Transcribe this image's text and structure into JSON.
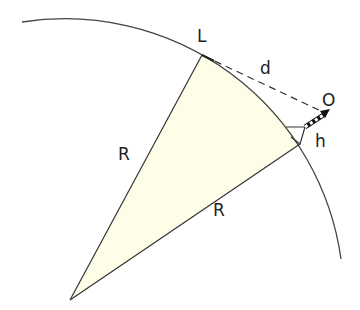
{
  "diagram": {
    "labels": {
      "horizon_point": "L",
      "observer": "O",
      "distance": "d",
      "height": "h",
      "radius_left": "R",
      "radius_right": "R"
    },
    "colors": {
      "sector_fill": "#fdfde8",
      "line": "#333333",
      "text": "#222222"
    },
    "geometry": {
      "center": [
        70,
        300
      ],
      "radius": 278,
      "horizon_point": [
        202,
        55
      ],
      "observer_point": [
        326,
        112
      ],
      "tower_base": [
        300,
        144
      ]
    }
  }
}
